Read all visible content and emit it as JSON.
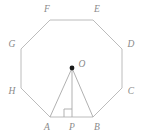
{
  "figure": {
    "shape_name": "regular-octagon",
    "stroke_color": "#b4b4b4",
    "label_color": "#8a8a8a",
    "center_dot_color": "#1a1a1a",
    "background_color": "#ffffff",
    "canvas": {
      "width": 143,
      "height": 140
    },
    "vertices": [
      {
        "id": "A",
        "label": "A",
        "x": 50,
        "y": 117,
        "label_x": 47,
        "label_y": 128
      },
      {
        "id": "B",
        "label": "B",
        "x": 93,
        "y": 117,
        "label_x": 97,
        "label_y": 128
      },
      {
        "id": "C",
        "label": "C",
        "x": 122,
        "y": 88,
        "label_x": 131,
        "label_y": 92
      },
      {
        "id": "D",
        "label": "D",
        "x": 122,
        "y": 49,
        "label_x": 131,
        "label_y": 45
      },
      {
        "id": "E",
        "label": "E",
        "x": 93,
        "y": 20,
        "label_x": 97,
        "label_y": 10
      },
      {
        "id": "F",
        "label": "F",
        "x": 50,
        "y": 20,
        "label_x": 47,
        "label_y": 10
      },
      {
        "id": "G",
        "label": "G",
        "x": 21,
        "y": 49,
        "label_x": 12,
        "label_y": 45
      },
      {
        "id": "H",
        "label": "H",
        "x": 21,
        "y": 88,
        "label_x": 12,
        "label_y": 92
      }
    ],
    "points": [
      {
        "id": "O",
        "label": "O",
        "x": 72,
        "y": 68,
        "label_x": 82,
        "label_y": 65,
        "kind": "center",
        "marked": true
      },
      {
        "id": "P",
        "label": "P",
        "x": 72,
        "y": 117,
        "label_x": 72,
        "label_y": 128,
        "kind": "foot-of-perpendicular",
        "marked": false
      }
    ],
    "segments": [
      {
        "id": "OA",
        "from": "O",
        "to": "A",
        "kind": "radius"
      },
      {
        "id": "OB",
        "from": "O",
        "to": "B",
        "kind": "radius"
      },
      {
        "id": "OP",
        "from": "O",
        "to": "P",
        "kind": "apothem"
      }
    ],
    "right_angle": {
      "at": "P",
      "size": 8,
      "orientation": "up-left"
    },
    "polygon_points": "50,117 93,117 122,88 122,49 93,20 50,20 21,49 21,88"
  }
}
